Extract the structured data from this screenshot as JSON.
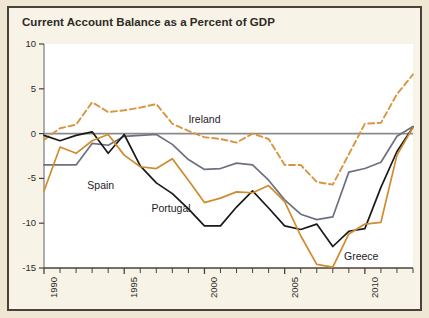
{
  "chart_data": {
    "type": "line",
    "title": "Current Account Balance as a Percent of GDP",
    "xlabel": "",
    "ylabel": "",
    "xlim": [
      1990,
      2013
    ],
    "ylim": [
      -15,
      10
    ],
    "yticks": [
      10,
      5,
      0,
      -5,
      -10,
      -15
    ],
    "ytick_labels": [
      "10",
      "5",
      "0",
      "-5",
      "-10",
      "-15"
    ],
    "xticks": [
      1990,
      1995,
      2000,
      2005,
      2010
    ],
    "xtick_labels": [
      "1990",
      "1995",
      "2000",
      "2005",
      "2010"
    ],
    "minor_xtick_interval": 1,
    "grid": false,
    "zero_line": true,
    "legend": "inline-labels",
    "x": [
      1990,
      1991,
      1992,
      1993,
      1994,
      1995,
      1996,
      1997,
      1998,
      1999,
      2000,
      2001,
      2002,
      2003,
      2004,
      2005,
      2006,
      2007,
      2008,
      2009,
      2010,
      2011,
      2012,
      2013
    ],
    "series": [
      {
        "name": "Ireland",
        "color": "#d8963f",
        "style": "dashed",
        "values": [
          -0.7,
          0.6,
          1.0,
          3.5,
          2.4,
          2.6,
          2.9,
          3.3,
          1.1,
          0.3,
          -0.4,
          -0.6,
          -1.0,
          0.0,
          -0.6,
          -3.5,
          -3.5,
          -5.4,
          -5.7,
          -2.3,
          1.1,
          1.2,
          4.4,
          6.6
        ]
      },
      {
        "name": "Spain",
        "color": "#6b7180",
        "style": "solid",
        "values": [
          -3.5,
          -3.5,
          -3.5,
          -1.1,
          -1.3,
          -0.3,
          -0.2,
          -0.1,
          -1.2,
          -2.9,
          -4.0,
          -3.9,
          -3.3,
          -3.5,
          -5.2,
          -7.4,
          -9.0,
          -9.6,
          -9.3,
          -4.3,
          -3.9,
          -3.2,
          -0.3,
          0.8
        ]
      },
      {
        "name": "Portugal",
        "color": "#1a1a1a",
        "style": "solid",
        "values": [
          -0.2,
          -0.8,
          -0.2,
          0.2,
          -2.2,
          -0.1,
          -3.6,
          -5.5,
          -6.7,
          -8.4,
          -10.3,
          -10.3,
          -8.2,
          -6.4,
          -8.3,
          -10.3,
          -10.7,
          -10.1,
          -12.6,
          -10.9,
          -10.6,
          -6.0,
          -2.0,
          0.7
        ]
      },
      {
        "name": "Greece",
        "color": "#cf8b2e",
        "style": "solid",
        "values": [
          -6.4,
          -1.5,
          -2.2,
          -0.8,
          -0.1,
          -2.4,
          -3.7,
          -3.9,
          -2.8,
          -5.2,
          -7.7,
          -7.2,
          -6.5,
          -6.6,
          -5.8,
          -7.6,
          -11.4,
          -14.6,
          -14.9,
          -11.2,
          -10.1,
          -9.9,
          -2.4,
          0.7
        ]
      }
    ],
    "annotations": [
      {
        "text": "Ireland",
        "x": 1999.0,
        "y": 1.5
      },
      {
        "text": "Spain",
        "x": 1992.7,
        "y": -5.8
      },
      {
        "text": "Portugal",
        "x": 1996.7,
        "y": -8.4
      },
      {
        "text": "Greece",
        "x": 2008.7,
        "y": -13.8
      }
    ]
  }
}
